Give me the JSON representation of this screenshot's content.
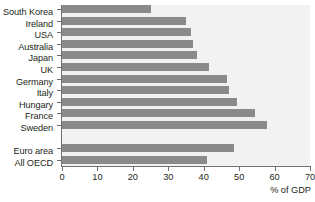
{
  "chart_data": {
    "type": "bar",
    "orientation": "horizontal",
    "title": "",
    "xlabel": "% of GDP",
    "ylabel": "",
    "xlim": [
      0,
      70
    ],
    "xticks": [
      0,
      10,
      20,
      30,
      40,
      50,
      60,
      70
    ],
    "grid": false,
    "legend": null,
    "categories": [
      "South Korea",
      "Ireland",
      "USA",
      "Australia",
      "Japan",
      "UK",
      "Germany",
      "Italy",
      "Hungary",
      "France",
      "Sweden",
      "",
      "Euro area",
      "All OECD"
    ],
    "values": [
      25,
      35,
      36.5,
      37,
      38,
      41.5,
      46.5,
      47,
      49.5,
      54.5,
      58,
      null,
      48.5,
      41
    ],
    "bar_color": "#8a8a8a",
    "plot_background": "#f2f2f2",
    "axis_color": "#6f6f6f",
    "text_color": "#231f20"
  }
}
